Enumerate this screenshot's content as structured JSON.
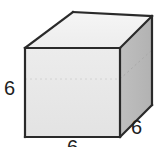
{
  "figure": {
    "kind": "cube-diagram",
    "background_color": "#ffffff",
    "faces": {
      "front": {
        "name": "front-face",
        "fill": "#e8e8e8",
        "points": "25,48 120,48 120,137 25,137"
      },
      "top": {
        "name": "top-face",
        "fill": "#f1f1f1",
        "points": "25,48 73,12 152,16 120,48"
      },
      "right": {
        "name": "right-face",
        "fill": "#b8b8b8",
        "points": "120,48 152,16 152,105 120,137"
      }
    },
    "outline": {
      "color": "#2a2a2a",
      "width": 2.2
    },
    "hidden_edges": {
      "color": "#cfcfcf",
      "width": 1,
      "dash": "2 3",
      "front": "25,79 120,79",
      "right": "120,79 152,50"
    },
    "labels": [
      {
        "id": "left",
        "name": "edge-label-left",
        "text": "6"
      },
      {
        "id": "right",
        "name": "edge-label-right",
        "text": "6"
      },
      {
        "id": "bottom",
        "name": "edge-label-bottom",
        "text": "6"
      }
    ]
  }
}
